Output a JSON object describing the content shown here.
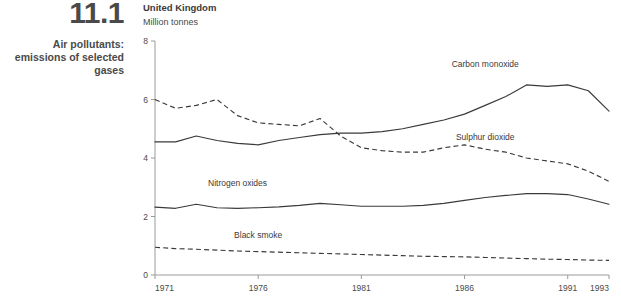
{
  "caption": {
    "number": "11.1",
    "title": "Air pollutants: emissions of selected gases"
  },
  "header": {
    "country": "United Kingdom",
    "units": "Million tonnes"
  },
  "chart_data": {
    "type": "line",
    "title": "Air pollutants: emissions of selected gases",
    "subtitle": "United Kingdom",
    "xlabel": "",
    "ylabel": "Million tonnes",
    "xlim": [
      1971,
      1993
    ],
    "ylim": [
      0,
      8
    ],
    "yticks": [
      0,
      2,
      4,
      6,
      8
    ],
    "xticks": [
      1971,
      1976,
      1981,
      1986,
      1991,
      1993
    ],
    "xtick_labels": [
      "1971",
      "1976",
      "1981",
      "1986",
      "1991",
      "1993"
    ],
    "ytick_labels": [
      "0",
      "2",
      "4",
      "6",
      "8"
    ],
    "grid": false,
    "legend": "inline-labels",
    "x": [
      1971,
      1972,
      1973,
      1974,
      1975,
      1976,
      1977,
      1978,
      1979,
      1980,
      1981,
      1982,
      1983,
      1984,
      1985,
      1986,
      1987,
      1988,
      1989,
      1990,
      1991,
      1992,
      1993
    ],
    "series": [
      {
        "name": "Carbon monoxide",
        "style": "solid",
        "label_x": 1987,
        "label_y": 7.1,
        "values": [
          4.55,
          4.55,
          4.75,
          4.6,
          4.5,
          4.45,
          4.6,
          4.7,
          4.8,
          4.85,
          4.85,
          4.9,
          5.0,
          5.15,
          5.3,
          5.5,
          5.8,
          6.1,
          6.5,
          6.45,
          6.5,
          6.3,
          5.6
        ]
      },
      {
        "name": "Sulphur dioxide",
        "style": "dashed",
        "label_x": 1987,
        "label_y": 4.6,
        "values": [
          6.0,
          5.7,
          5.8,
          6.0,
          5.45,
          5.2,
          5.15,
          5.1,
          5.35,
          4.75,
          4.35,
          4.25,
          4.2,
          4.2,
          4.35,
          4.45,
          4.3,
          4.2,
          4.0,
          3.9,
          3.8,
          3.55,
          3.2
        ]
      },
      {
        "name": "Nitrogen oxides",
        "style": "solid",
        "label_x": 1975,
        "label_y": 3.05,
        "values": [
          2.32,
          2.28,
          2.42,
          2.3,
          2.28,
          2.3,
          2.33,
          2.38,
          2.45,
          2.4,
          2.35,
          2.35,
          2.35,
          2.38,
          2.45,
          2.55,
          2.65,
          2.72,
          2.78,
          2.78,
          2.75,
          2.6,
          2.42
        ]
      },
      {
        "name": "Black smoke",
        "style": "dashed",
        "label_x": 1976,
        "label_y": 1.25,
        "values": [
          0.95,
          0.9,
          0.88,
          0.85,
          0.82,
          0.8,
          0.78,
          0.76,
          0.74,
          0.72,
          0.7,
          0.68,
          0.66,
          0.64,
          0.63,
          0.62,
          0.6,
          0.58,
          0.56,
          0.54,
          0.53,
          0.51,
          0.5
        ]
      }
    ]
  }
}
